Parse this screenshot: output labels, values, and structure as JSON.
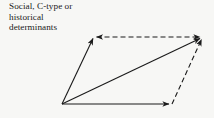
{
  "caption": {
    "lines": [
      "Social, C-type or",
      "historical",
      "determinants"
    ],
    "text": "Social, C-type or\nhistorical\ndeterminants"
  },
  "colors": {
    "background": "#f7f7f5",
    "stroke": "#1a1a1a",
    "text": "#1a1a1a"
  },
  "diagram": {
    "type": "vector-parallelogram",
    "canvas": {
      "width": 214,
      "height": 118
    },
    "vertices": {
      "origin": {
        "x": 62,
        "y": 104
      },
      "upper_left": {
        "x": 94,
        "y": 37
      },
      "upper_right": {
        "x": 203,
        "y": 37
      },
      "lower_right": {
        "x": 172,
        "y": 104
      }
    },
    "edges": [
      {
        "name": "vector-origin-to-upper-left",
        "from": "origin",
        "to": "upper_left",
        "style": "solid",
        "arrow": "end"
      },
      {
        "name": "vector-origin-to-lower-right",
        "from": "origin",
        "to": "lower_right",
        "style": "solid",
        "arrow": "end"
      },
      {
        "name": "resultant-diagonal",
        "from": "origin",
        "to": "upper_right",
        "style": "solid",
        "arrow": "end"
      },
      {
        "name": "dashed-top-edge",
        "from": "upper_left",
        "to": "upper_right",
        "style": "dashed",
        "arrow": "both"
      },
      {
        "name": "dashed-right-edge",
        "from": "lower_right",
        "to": "upper_right",
        "style": "dashed",
        "arrow": "end"
      }
    ],
    "stroke_width": 1.1,
    "dash_pattern": "5 3"
  }
}
